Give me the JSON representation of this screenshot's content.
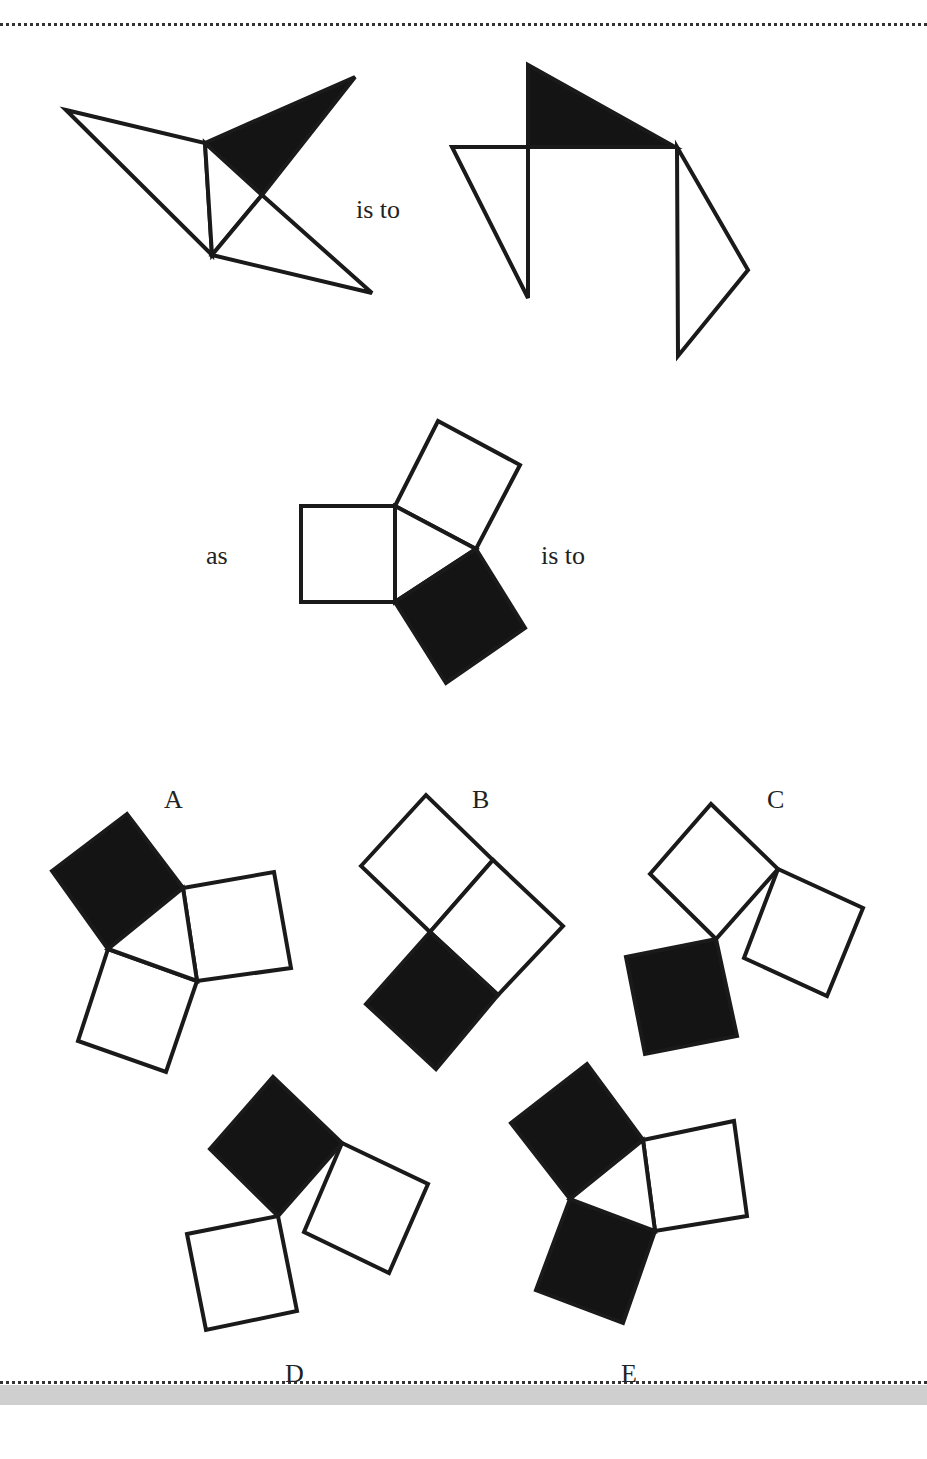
{
  "puzzle": {
    "connectors": {
      "is_to_1": "is to",
      "as": "as",
      "is_to_2": "is to"
    },
    "option_labels": [
      "A",
      "B",
      "C",
      "D",
      "E"
    ],
    "colors": {
      "stroke": "#1a1a1a",
      "fill_dark": "#141414",
      "fill_light": "#ffffff",
      "band": "#cfcfcf"
    }
  },
  "figures": {
    "fig1_source": {
      "polygons": [
        {
          "points": "66,110 205,143 212,255",
          "fill": "light"
        },
        {
          "points": "205,143 355,77 262,195",
          "fill": "dark"
        },
        {
          "points": "205,143 262,195 212,255",
          "fill": "light"
        },
        {
          "points": "262,195 372,293 212,255",
          "fill": "light"
        }
      ]
    },
    "fig1_target": {
      "polygons": [
        {
          "points": "528,65 528,147 675,147",
          "fill": "dark"
        },
        {
          "points": "452,147 528,147 528,298",
          "fill": "light"
        },
        {
          "points": "677,147 748,270 678,356",
          "fill": "light"
        }
      ]
    },
    "fig2_source": {
      "polygons": [
        {
          "points": "301,506 395,506 395,602 301,602",
          "fill": "light"
        },
        {
          "points": "395,506 438,421 520,465 476,549",
          "fill": "light"
        },
        {
          "points": "395,506 476,549 395,602",
          "fill": "light"
        },
        {
          "points": "395,602 476,549 525,628 446,683",
          "fill": "dark"
        }
      ]
    },
    "option_A": {
      "polygons": [
        {
          "points": "52,871 127,814 183,888 108,949",
          "fill": "dark"
        },
        {
          "points": "183,888 274,872 291,968 197,981",
          "fill": "light"
        },
        {
          "points": "108,949 197,981 166,1072 78,1041",
          "fill": "light"
        },
        {
          "points": "183,888 197,981 108,949",
          "fill": "light"
        }
      ]
    },
    "option_B": {
      "polygons": [
        {
          "points": "361,866 426,795 493,860 430,932",
          "fill": "light"
        },
        {
          "points": "493,860 563,926 498,995 430,932",
          "fill": "light"
        },
        {
          "points": "430,932 498,995 436,1069 366,1004",
          "fill": "dark"
        }
      ]
    },
    "option_C": {
      "polygons": [
        {
          "points": "650,874 711,804 778,869 716,939",
          "fill": "light"
        },
        {
          "points": "778,869 863,908 827,996 744,958",
          "fill": "light"
        },
        {
          "points": "626,957 716,939 737,1036 645,1054",
          "fill": "dark"
        }
      ]
    },
    "option_D": {
      "polygons": [
        {
          "points": "210,1149 273,1077 342,1143 278,1216",
          "fill": "dark"
        },
        {
          "points": "342,1143 428,1184 389,1273 304,1232",
          "fill": "light"
        },
        {
          "points": "187,1234 278,1216 297,1311 206,1330",
          "fill": "light"
        }
      ]
    },
    "option_E": {
      "polygons": [
        {
          "points": "511,1123 587,1064 643,1140 570,1199",
          "fill": "dark"
        },
        {
          "points": "643,1140 734,1121 747,1216 655,1231",
          "fill": "light"
        },
        {
          "points": "570,1199 655,1231 623,1323 536,1290",
          "fill": "dark"
        },
        {
          "points": "643,1140 655,1231 570,1199",
          "fill": "light"
        }
      ]
    }
  }
}
